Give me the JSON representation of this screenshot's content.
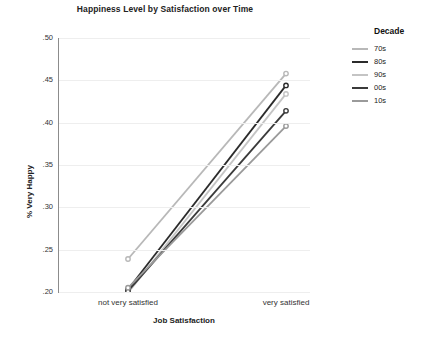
{
  "chart_data": {
    "type": "line",
    "title": "Happiness Level by Satisfaction over Time",
    "xlabel": "Job Satisfaction",
    "ylabel": "% Very Happy",
    "categories": [
      "not very satisfied",
      "very satisfied"
    ],
    "ylim": [
      0.2,
      0.5
    ],
    "ytick_labels": [
      ".50",
      ".45",
      ".40",
      ".35",
      ".30",
      ".25",
      ".20"
    ],
    "ytick_values": [
      0.5,
      0.45,
      0.4,
      0.35,
      0.3,
      0.25,
      0.2
    ],
    "grid": true,
    "legend_position": "right",
    "legend_title": "Decade",
    "series": [
      {
        "name": "70s",
        "values": [
          0.239,
          0.458
        ],
        "color": "#b8b8b8"
      },
      {
        "name": "80s",
        "values": [
          0.203,
          0.444
        ],
        "color": "#2b2b2b"
      },
      {
        "name": "90s",
        "values": [
          0.199,
          0.434
        ],
        "color": "#c4c4c4"
      },
      {
        "name": "00s",
        "values": [
          0.201,
          0.414
        ],
        "color": "#3a3a3a"
      },
      {
        "name": "10s",
        "values": [
          0.205,
          0.396
        ],
        "color": "#9a9a9a"
      }
    ]
  },
  "chart": {
    "title": "Happiness Level by Satisfaction over Time",
    "y_axis_title": "% Very Happy",
    "x_axis_title": "Job Satisfaction",
    "y_ticks": [
      {
        "label": ".50"
      },
      {
        "label": ".45"
      },
      {
        "label": ".40"
      },
      {
        "label": ".35"
      },
      {
        "label": ".30"
      },
      {
        "label": ".25"
      },
      {
        "label": ".20"
      }
    ],
    "x_ticks": [
      {
        "label": "not very satisfied"
      },
      {
        "label": "very satisfied"
      }
    ]
  },
  "legend": {
    "title": "Decade",
    "items": [
      {
        "label": "70s",
        "color": "#b8b8b8"
      },
      {
        "label": "80s",
        "color": "#2b2b2b"
      },
      {
        "label": "90s",
        "color": "#c4c4c4"
      },
      {
        "label": "00s",
        "color": "#3a3a3a"
      },
      {
        "label": "10s",
        "color": "#9a9a9a"
      }
    ]
  }
}
